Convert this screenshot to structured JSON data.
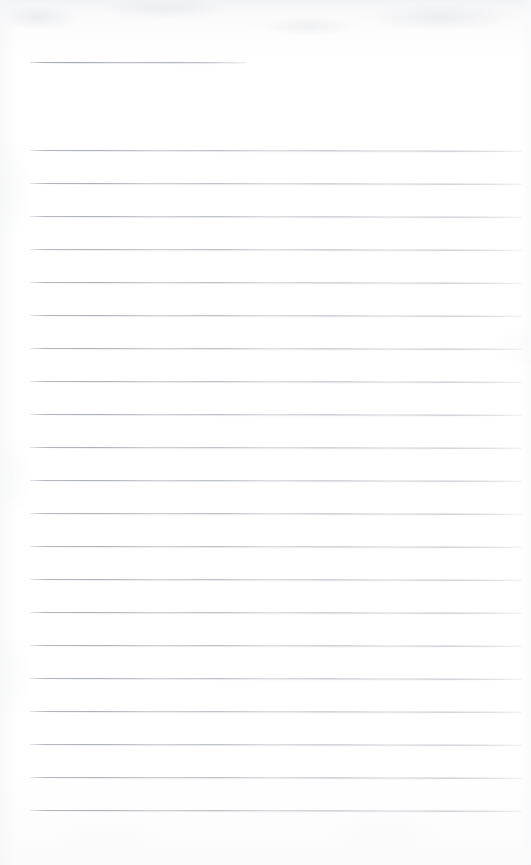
{
  "document": {
    "kind": "scanned-ruled-notepad-page",
    "orientation": "portrait",
    "page_width_px": 531,
    "page_height_px": 865,
    "background_color": "#fefefe",
    "rule_color": "#adb2b9",
    "rule_thickness_px": 1,
    "rule_left_x": 30,
    "rule_right_x": 522,
    "content_text": "",
    "handwriting_present": "none",
    "typed_text_present": "none"
  },
  "header_rule": {
    "name": "short-heading-rule",
    "description": "short ruled line near the top of the page",
    "top": 62,
    "left": 30,
    "width": 216
  },
  "body_rules": [
    {
      "index": 1,
      "top": 150,
      "left": 30,
      "width": 492
    },
    {
      "index": 2,
      "top": 183,
      "left": 30,
      "width": 492
    },
    {
      "index": 3,
      "top": 216,
      "left": 30,
      "width": 492
    },
    {
      "index": 4,
      "top": 249,
      "left": 30,
      "width": 492
    },
    {
      "index": 5,
      "top": 282,
      "left": 30,
      "width": 492
    },
    {
      "index": 6,
      "top": 315,
      "left": 30,
      "width": 492
    },
    {
      "index": 7,
      "top": 348,
      "left": 30,
      "width": 492
    },
    {
      "index": 8,
      "top": 381,
      "left": 30,
      "width": 492
    },
    {
      "index": 9,
      "top": 414,
      "left": 30,
      "width": 492
    },
    {
      "index": 10,
      "top": 447,
      "left": 30,
      "width": 492
    },
    {
      "index": 11,
      "top": 480,
      "left": 30,
      "width": 492
    },
    {
      "index": 12,
      "top": 513,
      "left": 30,
      "width": 492
    },
    {
      "index": 13,
      "top": 546,
      "left": 30,
      "width": 492
    },
    {
      "index": 14,
      "top": 579,
      "left": 30,
      "width": 492
    },
    {
      "index": 15,
      "top": 612,
      "left": 30,
      "width": 492
    },
    {
      "index": 16,
      "top": 645,
      "left": 30,
      "width": 492
    },
    {
      "index": 17,
      "top": 678,
      "left": 30,
      "width": 492
    },
    {
      "index": 18,
      "top": 711,
      "left": 30,
      "width": 492
    },
    {
      "index": 19,
      "top": 744,
      "left": 30,
      "width": 492
    },
    {
      "index": 20,
      "top": 777,
      "left": 30,
      "width": 492
    },
    {
      "index": 21,
      "top": 810,
      "left": 30,
      "width": 492
    }
  ]
}
